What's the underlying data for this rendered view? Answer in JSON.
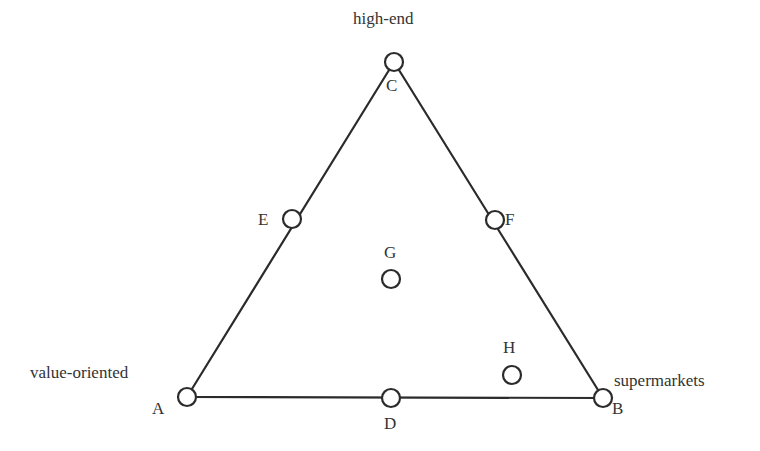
{
  "diagram": {
    "type": "ternary-triangle",
    "vertex_labels": {
      "top": "high-end",
      "bottom_left": "value-oriented",
      "bottom_right": "supermarkets"
    },
    "points": [
      {
        "id": "A",
        "label": "A",
        "cx": 187,
        "cy": 397,
        "lx": 152,
        "ly": 414
      },
      {
        "id": "B",
        "label": "B",
        "cx": 603,
        "cy": 398,
        "lx": 612,
        "ly": 414
      },
      {
        "id": "C",
        "label": "C",
        "cx": 394,
        "cy": 62,
        "lx": 386,
        "ly": 91
      },
      {
        "id": "D",
        "label": "D",
        "cx": 391,
        "cy": 398,
        "lx": 384,
        "ly": 429
      },
      {
        "id": "E",
        "label": "E",
        "cx": 292,
        "cy": 219,
        "lx": 258,
        "ly": 225
      },
      {
        "id": "F",
        "label": "F",
        "cx": 495,
        "cy": 220,
        "lx": 505,
        "ly": 225
      },
      {
        "id": "G",
        "label": "G",
        "cx": 391,
        "cy": 279,
        "lx": 384,
        "ly": 258
      },
      {
        "id": "H",
        "label": "H",
        "cx": 512,
        "cy": 375,
        "lx": 503,
        "ly": 353
      }
    ],
    "edges": [
      [
        "A",
        "C"
      ],
      [
        "C",
        "B"
      ],
      [
        "A",
        "B"
      ]
    ],
    "colors": {
      "stroke": "#2b2b2b",
      "text": "#333333",
      "background": "#ffffff"
    }
  }
}
